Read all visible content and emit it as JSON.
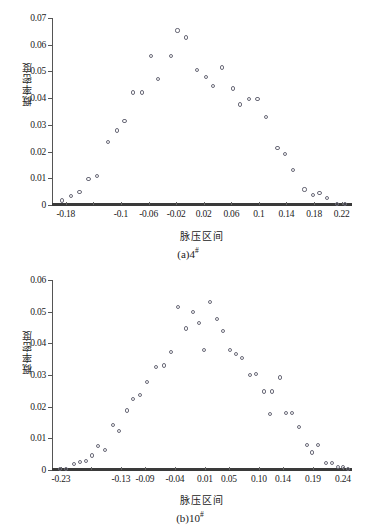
{
  "figure": {
    "panels": [
      "a",
      "b"
    ]
  },
  "chart_data": [
    {
      "type": "scatter",
      "panel_label": "(a)4",
      "panel_superscript": "#",
      "title": "",
      "xlabel": "脉压区间",
      "ylabel": "概率密度",
      "xlim": [
        -0.2,
        0.235
      ],
      "ylim": [
        0,
        0.07
      ],
      "grid": false,
      "legend": null,
      "xticks": [
        -0.18,
        -0.14,
        -0.1,
        -0.06,
        -0.02,
        0.02,
        0.06,
        0.1,
        0.14,
        0.18,
        0.22
      ],
      "xticklabels": [
        "-0.18",
        "",
        "-0.1",
        "-0.06",
        "-0.02",
        "0.02",
        "0.06",
        "0.1",
        "0.14",
        "0.18",
        "0.22"
      ],
      "yticks": [
        0,
        0.01,
        0.02,
        0.03,
        0.04,
        0.05,
        0.06,
        0.07
      ],
      "yticklabels": [
        "0",
        "0.01",
        "0.02",
        "0.03",
        "0.04",
        "0.05",
        "0.06",
        "0.07"
      ],
      "baseline_series": {
        "y": 0,
        "style": "thick-line",
        "color": "#3a3a3a"
      },
      "points": [
        {
          "x": -0.185,
          "y": 0.0017
        },
        {
          "x": -0.172,
          "y": 0.0035
        },
        {
          "x": -0.16,
          "y": 0.0048
        },
        {
          "x": -0.147,
          "y": 0.0097
        },
        {
          "x": -0.135,
          "y": 0.011
        },
        {
          "x": -0.119,
          "y": 0.0235
        },
        {
          "x": -0.106,
          "y": 0.0279
        },
        {
          "x": -0.095,
          "y": 0.0313
        },
        {
          "x": -0.082,
          "y": 0.0421
        },
        {
          "x": -0.069,
          "y": 0.0421
        },
        {
          "x": -0.057,
          "y": 0.0559
        },
        {
          "x": -0.046,
          "y": 0.0471
        },
        {
          "x": -0.028,
          "y": 0.0559
        },
        {
          "x": -0.018,
          "y": 0.0653
        },
        {
          "x": -0.006,
          "y": 0.0627
        },
        {
          "x": 0.01,
          "y": 0.0506
        },
        {
          "x": 0.023,
          "y": 0.048
        },
        {
          "x": 0.034,
          "y": 0.0444
        },
        {
          "x": 0.046,
          "y": 0.0515
        },
        {
          "x": 0.062,
          "y": 0.0436
        },
        {
          "x": 0.073,
          "y": 0.0376
        },
        {
          "x": 0.086,
          "y": 0.0396
        },
        {
          "x": 0.098,
          "y": 0.0396
        },
        {
          "x": 0.11,
          "y": 0.0329
        },
        {
          "x": 0.127,
          "y": 0.0214
        },
        {
          "x": 0.138,
          "y": 0.0191
        },
        {
          "x": 0.15,
          "y": 0.0132
        },
        {
          "x": 0.166,
          "y": 0.0058
        },
        {
          "x": 0.178,
          "y": 0.0038
        },
        {
          "x": 0.188,
          "y": 0.0046
        },
        {
          "x": 0.199,
          "y": 0.0027
        },
        {
          "x": 0.213,
          "y": 0.0003
        },
        {
          "x": 0.225,
          "y": 0.0003
        }
      ]
    },
    {
      "type": "scatter",
      "panel_label": "(b)10",
      "panel_superscript": "#",
      "title": "",
      "xlabel": "脉压区间",
      "ylabel": "概率密度",
      "xlim": [
        -0.245,
        0.255
      ],
      "ylim": [
        0,
        0.06
      ],
      "grid": false,
      "legend": null,
      "xticks": [
        -0.23,
        -0.18,
        -0.13,
        -0.09,
        -0.04,
        0.01,
        0.05,
        0.1,
        0.14,
        0.19,
        0.24
      ],
      "xticklabels": [
        "-0.23",
        "",
        "-0.13",
        "-0.09",
        "-0.04",
        "0.01",
        "0.05",
        "0.10",
        "0.14",
        "0.19",
        "0.24"
      ],
      "yticks": [
        0,
        0.01,
        0.02,
        0.03,
        0.04,
        0.05,
        0.06
      ],
      "yticklabels": [
        "0",
        "0.01",
        "0.02",
        "0.03",
        "0.04",
        "0.05",
        "0.06"
      ],
      "baseline_series": {
        "y": 0,
        "style": "thick-line",
        "color": "#3a3a3a"
      },
      "points": [
        {
          "x": -0.232,
          "y": 0.0004
        },
        {
          "x": -0.222,
          "y": 0.0004
        },
        {
          "x": -0.208,
          "y": 0.0018
        },
        {
          "x": -0.198,
          "y": 0.0024
        },
        {
          "x": -0.188,
          "y": 0.0028
        },
        {
          "x": -0.178,
          "y": 0.0046
        },
        {
          "x": -0.168,
          "y": 0.0077
        },
        {
          "x": -0.157,
          "y": 0.0064
        },
        {
          "x": -0.143,
          "y": 0.0141
        },
        {
          "x": -0.133,
          "y": 0.0123
        },
        {
          "x": -0.12,
          "y": 0.0188
        },
        {
          "x": -0.11,
          "y": 0.0224
        },
        {
          "x": -0.099,
          "y": 0.0237
        },
        {
          "x": -0.086,
          "y": 0.0278
        },
        {
          "x": -0.072,
          "y": 0.0324
        },
        {
          "x": -0.059,
          "y": 0.033
        },
        {
          "x": -0.046,
          "y": 0.0372
        },
        {
          "x": -0.035,
          "y": 0.0514
        },
        {
          "x": -0.022,
          "y": 0.0447
        },
        {
          "x": -0.01,
          "y": 0.0499
        },
        {
          "x": 0.0,
          "y": 0.0463
        },
        {
          "x": 0.008,
          "y": 0.0378
        },
        {
          "x": 0.019,
          "y": 0.0531
        },
        {
          "x": 0.03,
          "y": 0.0476
        },
        {
          "x": 0.04,
          "y": 0.0439
        },
        {
          "x": 0.051,
          "y": 0.0379
        },
        {
          "x": 0.061,
          "y": 0.0366
        },
        {
          "x": 0.071,
          "y": 0.0353
        },
        {
          "x": 0.085,
          "y": 0.0299
        },
        {
          "x": 0.095,
          "y": 0.0302
        },
        {
          "x": 0.108,
          "y": 0.0248
        },
        {
          "x": 0.121,
          "y": 0.0248
        },
        {
          "x": 0.118,
          "y": 0.0176
        },
        {
          "x": 0.135,
          "y": 0.0292
        },
        {
          "x": 0.145,
          "y": 0.0181
        },
        {
          "x": 0.155,
          "y": 0.0181
        },
        {
          "x": 0.166,
          "y": 0.0137
        },
        {
          "x": 0.18,
          "y": 0.0079
        },
        {
          "x": 0.188,
          "y": 0.0055
        },
        {
          "x": 0.198,
          "y": 0.0079
        },
        {
          "x": 0.212,
          "y": 0.0021
        },
        {
          "x": 0.221,
          "y": 0.0021
        },
        {
          "x": 0.232,
          "y": 0.001
        },
        {
          "x": 0.24,
          "y": 0.001
        },
        {
          "x": 0.249,
          "y": 0.0004
        }
      ]
    }
  ]
}
